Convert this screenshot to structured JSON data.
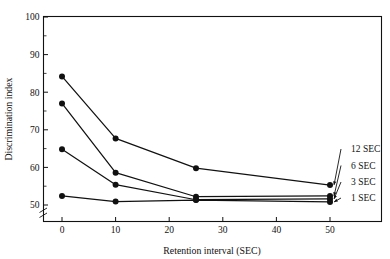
{
  "chart_data": {
    "type": "line",
    "title": "",
    "xlabel": "Retention interval (SEC)",
    "ylabel": "Discrimination index",
    "x": [
      0,
      10,
      25,
      50
    ],
    "xlim": [
      0,
      50
    ],
    "ylim": [
      50,
      100
    ],
    "x_ticks": [
      "0",
      "10",
      "20",
      "30",
      "40",
      "50"
    ],
    "x_tick_values": [
      0,
      10,
      20,
      30,
      40,
      50
    ],
    "y_ticks": [
      "50",
      "60",
      "70",
      "80",
      "90",
      "100"
    ],
    "y_tick_values": [
      50,
      60,
      70,
      80,
      90,
      100
    ],
    "y_minor_tick_values": [
      55,
      65,
      75,
      85,
      95
    ],
    "y_axis_break": true,
    "grid": false,
    "legend_position": "right-inline-annotations",
    "series": [
      {
        "name": "12 SEC",
        "values": [
          84.2,
          67.7,
          59.8,
          55.3
        ]
      },
      {
        "name": "6 SEC",
        "values": [
          77.0,
          58.6,
          52.2,
          52.4
        ]
      },
      {
        "name": "3 SEC",
        "values": [
          64.8,
          55.4,
          51.4,
          51.6
        ]
      },
      {
        "name": "1 SEC",
        "values": [
          52.4,
          50.9,
          51.3,
          50.8
        ]
      }
    ],
    "annotations": [
      {
        "label": "12 SEC",
        "points_to_series": "12 SEC",
        "points_to_x": 50
      },
      {
        "label": "6 SEC",
        "points_to_series": "6 SEC",
        "points_to_x": 50
      },
      {
        "label": "3 SEC",
        "points_to_series": "3 SEC",
        "points_to_x": 50
      },
      {
        "label": "1 SEC",
        "points_to_series": "1 SEC",
        "points_to_x": 50
      }
    ]
  }
}
